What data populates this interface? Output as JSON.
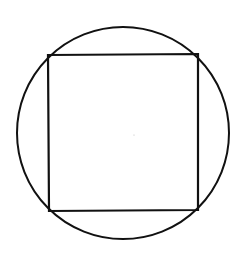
{
  "diagram": {
    "background": "#ffffff",
    "stroke_color": "#111111",
    "circle": {
      "cx": 123,
      "cy": 133,
      "r": 106,
      "stroke_width": 2
    },
    "square": {
      "points": "48,55 198,54 198,210 49,211",
      "stroke_width": 2.2
    },
    "center_dot": {
      "cx": 134,
      "cy": 135,
      "r": 0.6,
      "color": "#bbbbbb"
    }
  }
}
